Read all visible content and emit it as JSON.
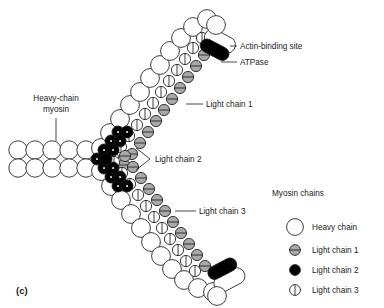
{
  "figure": {
    "caption": "(c)"
  },
  "callouts": {
    "actin_binding_site": "Actin-binding site",
    "atpase": "ATPase",
    "light_chain_1": "Light chain 1",
    "light_chain_2": "Light chain 2",
    "light_chain_3": "Light chain 3",
    "heavy_chain_myosin_line1": "Heavy-chain",
    "heavy_chain_myosin_line2": "myosin"
  },
  "legend": {
    "title": "Myosin chains",
    "items": [
      {
        "label": "Heavy chain",
        "symbol": "open-circle",
        "color": "#ffffff"
      },
      {
        "label": "Light chain 1",
        "symbol": "gray-circle-hline",
        "color": "#a9a9a9"
      },
      {
        "label": "Light chain 2",
        "symbol": "filled-circle",
        "color": "#000000"
      },
      {
        "label": "Light chain 3",
        "symbol": "open-circle-vline",
        "color": "#ffffff"
      }
    ]
  },
  "colors": {
    "outline": "#1a1a1a",
    "heavy_chain": "#ffffff",
    "light_chain_1": "#a9a9a9",
    "light_chain_2": "#000000",
    "light_chain_3": "#ffffff",
    "background": "#ffffff"
  }
}
